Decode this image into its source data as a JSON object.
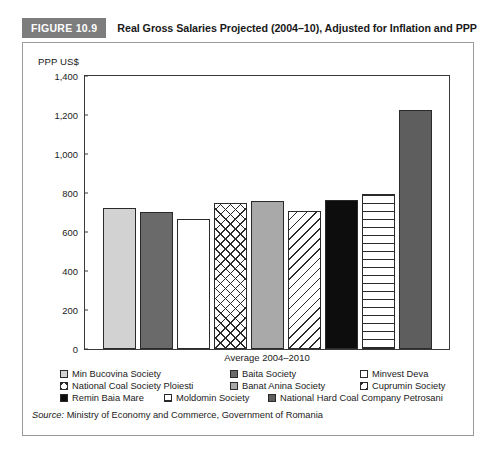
{
  "figure": {
    "badge": "FIGURE 10.9",
    "title": "Real Gross Salaries Projected (2004–10), Adjusted for Inflation and PPP",
    "badge_bg": "#7d7d7d",
    "badge_fg": "#ffffff"
  },
  "source": {
    "label": "Source:",
    "text": " Ministry of Economy and Commerce, Government of Romania"
  },
  "chart_data": {
    "type": "bar",
    "title": "Real Gross Salaries Projected (2004–10), Adjusted for Inflation and PPP",
    "xlabel": "Average 2004–2010",
    "ylabel": "PPP US$",
    "ylim": [
      0,
      1400
    ],
    "ytick_step": 200,
    "yticks": [
      "0",
      "200",
      "400",
      "600",
      "800",
      "1,000",
      "1,200",
      "1,400"
    ],
    "grid": false,
    "legend_position": "bottom",
    "categories": [
      "Min Bucovina Society",
      "Baita Society",
      "Minvest Deva",
      "National Coal Society Ploiesti",
      "Banat Anina Society",
      "Cuprumin Society",
      "Remin Baia Mare",
      "Moldomin Society",
      "National Hard Coal Company Petrosani"
    ],
    "values": [
      725,
      705,
      665,
      748,
      760,
      710,
      765,
      795,
      1225
    ],
    "bar_styles": [
      "f-lightgray",
      "f-darkgray",
      "f-white",
      "f-crosshatch",
      "f-midgray",
      "f-diaghatch",
      "f-black",
      "f-horizline",
      "f-darkgray2"
    ]
  },
  "legend": {
    "rows": [
      [
        {
          "label": "Min Bucovina Society",
          "style": "f-lightgray"
        },
        {
          "label": "Baita Society",
          "style": "f-darkgray"
        },
        {
          "label": "Minvest Deva",
          "style": "f-white"
        }
      ],
      [
        {
          "label": "National Coal Society Ploiesti",
          "style": "f-crosshatch"
        },
        {
          "label": "Banat Anina Society",
          "style": "f-midgray"
        },
        {
          "label": "Cuprumin Society",
          "style": "f-diaghatch"
        }
      ],
      [
        {
          "label": "Remin Baia Mare",
          "style": "f-black"
        },
        {
          "label": "Moldomin Society",
          "style": "f-horizline"
        },
        {
          "label": "National Hard Coal Company Petrosani",
          "style": "f-darkgray2"
        }
      ]
    ]
  }
}
